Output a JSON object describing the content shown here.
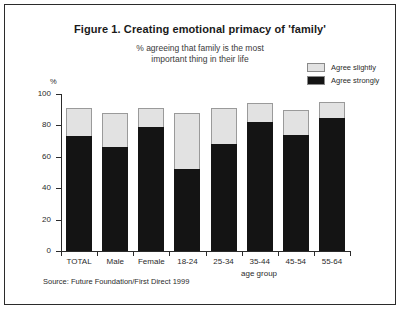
{
  "figure": {
    "title": "Figure 1. Creating emotional primacy of 'family'",
    "subtitle_line1": "% agreeing that family is the most",
    "subtitle_line2": "important thing in their life",
    "source": "Source: Future Foundation/First Direct 1999",
    "y_unit": "%",
    "frame_color": "#2b2b2b"
  },
  "colors": {
    "agree_slightly": "#e2e2e2",
    "agree_strongly": "#141414",
    "axis": "#2b2b2b",
    "background": "#ffffff"
  },
  "chart_data": {
    "type": "bar",
    "stacked": true,
    "title": "Figure 1. Creating emotional primacy of 'family'",
    "subtitle": "% agreeing that family is the most important thing in their life",
    "xlabel": "age group",
    "ylabel": "%",
    "ylim": [
      0,
      100
    ],
    "yticks": [
      0,
      20,
      40,
      60,
      80,
      100
    ],
    "ytick_labels": [
      "0",
      "20",
      "40",
      "60",
      "80",
      "100"
    ],
    "grid": false,
    "legend_position": "top-right",
    "categories": [
      "TOTAL",
      "Male",
      "Female",
      "18-24",
      "25-34",
      "35-44",
      "45-54",
      "55-64"
    ],
    "series": [
      {
        "name": "Agree strongly",
        "color": "#141414",
        "values": [
          73,
          66,
          79,
          52,
          68,
          82,
          74,
          85
        ]
      },
      {
        "name": "Agree slightly",
        "color": "#e2e2e2",
        "values": [
          18,
          22,
          12,
          36,
          23,
          12,
          16,
          10
        ]
      }
    ],
    "totals": [
      91,
      88,
      91,
      88,
      91,
      94,
      90,
      95
    ]
  }
}
